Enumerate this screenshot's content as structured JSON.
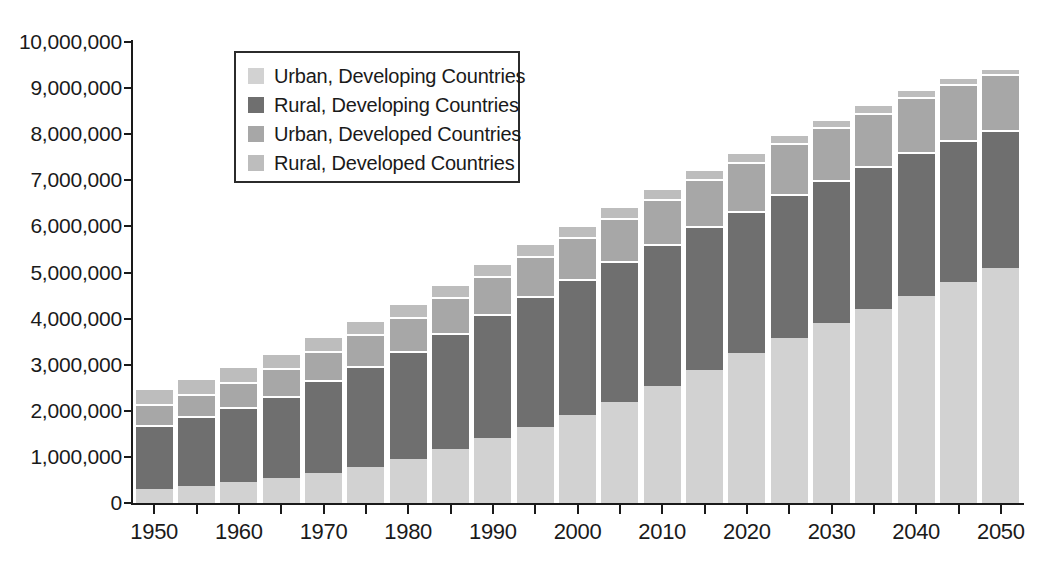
{
  "chart_data": {
    "type": "bar",
    "subtype": "stacked",
    "title": "",
    "xlabel": "",
    "ylabel": "",
    "ylim": [
      0,
      10000000
    ],
    "ytick_values": [
      0,
      1000000,
      2000000,
      3000000,
      4000000,
      5000000,
      6000000,
      7000000,
      8000000,
      9000000,
      10000000
    ],
    "ytick_labels": [
      "0",
      "1,000,000",
      "2,000,000",
      "3,000,000",
      "4,000,000",
      "5,000,000",
      "6,000,000",
      "7,000,000",
      "8,000,000",
      "9,000,000",
      "10,000,000"
    ],
    "grid": false,
    "legend_position": "top-left-inside",
    "categories": [
      "1950",
      "1955",
      "1960",
      "1965",
      "1970",
      "1975",
      "1980",
      "1985",
      "1990",
      "1995",
      "2000",
      "2005",
      "2010",
      "2015",
      "2020",
      "2025",
      "2030",
      "2035",
      "2040",
      "2045",
      "2050"
    ],
    "xtick_labels": [
      "1950",
      "1960",
      "1970",
      "1980",
      "1990",
      "2000",
      "2010",
      "2020",
      "2030",
      "2040",
      "2050"
    ],
    "series": [
      {
        "name": "Urban, Developing Countries",
        "color": "#d2d2d2",
        "stack_order": 1,
        "values": [
          300000,
          360000,
          450000,
          540000,
          650000,
          790000,
          960000,
          1170000,
          1400000,
          1640000,
          1900000,
          2200000,
          2530000,
          2890000,
          3250000,
          3580000,
          3900000,
          4210000,
          4500000,
          4800000,
          5100000
        ]
      },
      {
        "name": "Rural, Developing Countries",
        "color": "#6f6f6f",
        "stack_order": 2,
        "values": [
          1400000,
          1520000,
          1640000,
          1790000,
          2010000,
          2190000,
          2340000,
          2520000,
          2710000,
          2860000,
          2960000,
          3050000,
          3080000,
          3110000,
          3090000,
          3120000,
          3110000,
          3090000,
          3110000,
          3070000,
          3000000
        ]
      },
      {
        "name": "Urban, Developed Countries",
        "color": "#a7a7a7",
        "stack_order": 3,
        "values": [
          450000,
          490000,
          540000,
          590000,
          640000,
          690000,
          730000,
          780000,
          820000,
          860000,
          900000,
          940000,
          980000,
          1020000,
          1060000,
          1100000,
          1140000,
          1170000,
          1200000,
          1230000,
          1200000
        ]
      },
      {
        "name": "Rural, Developed Countries",
        "color": "#bdbdbd",
        "stack_order": 4,
        "values": [
          350000,
          340000,
          340000,
          330000,
          320000,
          310000,
          300000,
          290000,
          280000,
          270000,
          260000,
          250000,
          240000,
          230000,
          210000,
          200000,
          190000,
          180000,
          160000,
          150000,
          130000
        ]
      }
    ],
    "totals": [
      2500000,
      2710000,
      2970000,
      3250000,
      3620000,
      3980000,
      4330000,
      4760000,
      5210000,
      5630000,
      6020000,
      6440000,
      6830000,
      7250000,
      7610000,
      8000000,
      8340000,
      8650000,
      8970000,
      9250000,
      9430000
    ]
  },
  "legend": {
    "items": [
      {
        "label": "Urban, Developing Countries",
        "color": "#d2d2d2"
      },
      {
        "label": "Rural, Developing Countries",
        "color": "#6f6f6f"
      },
      {
        "label": "Urban, Developed Countries",
        "color": "#a7a7a7"
      },
      {
        "label": "Rural, Developed Countries",
        "color": "#bdbdbd"
      }
    ]
  },
  "colors": {
    "axis": "#1a1a1a",
    "background": "#ffffff",
    "legend_border": "#2b2b2b"
  }
}
